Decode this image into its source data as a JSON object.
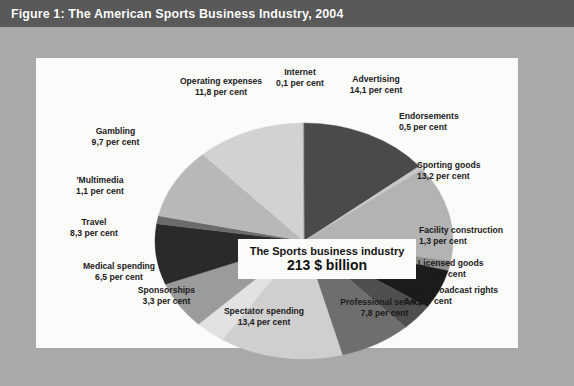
{
  "figure": {
    "title": "Figure 1: The American Sports Business Industry, 2004",
    "center_caption_line1": "The Sports business industry",
    "center_caption_line2": "213 $ billion",
    "unit_suffix": "per cent",
    "colors": {
      "title_band": "#595959",
      "frame": "#a9a9a9",
      "panel": "#fbfbf9"
    }
  },
  "chart_data": {
    "type": "pie",
    "title": "Figure 1: The American Sports Business Industry, 2004",
    "subtitle": "The Sports business industry 213 $ billion",
    "total_label": "213 $ billion",
    "value_unit": "per cent",
    "legend": "none",
    "grid": false,
    "start_angle_deg": 0,
    "direction": "clockwise",
    "categories": [
      "Advertising",
      "Endorsements",
      "Sporting goods",
      "Facility construction",
      "Licensed goods",
      "Media broadcast rights",
      "Professional services",
      "Spectator spending",
      "Sponsorships",
      "Medical spending",
      "Travel",
      "'Multimedia",
      "Gambling",
      "Operating expenses",
      "Internet"
    ],
    "values": [
      14.1,
      0.5,
      13.2,
      1.3,
      5.4,
      3.6,
      7.8,
      13.4,
      3.3,
      6.5,
      8.3,
      1.1,
      9.7,
      11.8,
      0.1
    ],
    "slice_colors": [
      "#4a4a4a",
      "#c9c9c9",
      "#b3b3b3",
      "#8e8e8e",
      "#1c1c1c",
      "#4f4f4f",
      "#6e6e6e",
      "#cfcfcf",
      "#e2e2e2",
      "#9b9b9b",
      "#2a2a2a",
      "#6b6b6b",
      "#b8b8b8",
      "#d2d2d2",
      "#9f9f9f"
    ],
    "slices": [
      {
        "label": "Advertising",
        "value": 14.1,
        "value_text": "14,1 per cent"
      },
      {
        "label": "Endorsements",
        "value": 0.5,
        "value_text": "0,5 per cent"
      },
      {
        "label": "Sporting goods",
        "value": 13.2,
        "value_text": "13,2 per cent"
      },
      {
        "label": "Facility construction",
        "value": 1.3,
        "value_text": "1,3 per cent"
      },
      {
        "label": "Licensed goods",
        "value": 5.4,
        "value_text": "5,4 per cent"
      },
      {
        "label": "Media broadcast rights",
        "value": 3.6,
        "value_text": "3,6 per cent"
      },
      {
        "label": "Professional services",
        "value": 7.8,
        "value_text": "7,8 per cent"
      },
      {
        "label": "Spectator spending",
        "value": 13.4,
        "value_text": "13,4 per cent"
      },
      {
        "label": "Sponsorships",
        "value": 3.3,
        "value_text": "3,3 per cent"
      },
      {
        "label": "Medical spending",
        "value": 6.5,
        "value_text": "6,5 per cent"
      },
      {
        "label": "Travel",
        "value": 8.3,
        "value_text": "8,3 per cent"
      },
      {
        "label": "'Multimedia",
        "value": 1.1,
        "value_text": "1,1 per cent"
      },
      {
        "label": "Gambling",
        "value": 9.7,
        "value_text": "9,7 per cent"
      },
      {
        "label": "Operating expenses",
        "value": 11.8,
        "value_text": "11,8 per cent"
      },
      {
        "label": "Internet",
        "value": 0.1,
        "value_text": "0,1 per cent"
      }
    ]
  },
  "labels": {
    "internet": {
      "name": "Internet",
      "value": "0,1 per cent"
    },
    "advertising": {
      "name": "Advertising",
      "value": "14,1 per cent"
    },
    "endorsements": {
      "name": "Endorsements",
      "value": "0,5 per cent"
    },
    "sporting_goods": {
      "name": "Sporting goods",
      "value": "13,2 per cent"
    },
    "facility": {
      "name": "Facility construction",
      "value": "1,3 per cent"
    },
    "licensed_goods": {
      "name": "Licensed goods",
      "value": "5,4 per cent"
    },
    "media_rights": {
      "name": "Media broadcast rights",
      "value": "3,6 per cent"
    },
    "professional": {
      "name": "Professional services",
      "value": "7,8 per cent"
    },
    "spectator": {
      "name": "Spectator spending",
      "value": "13,4 per cent"
    },
    "sponsorships": {
      "name": "Sponsorships",
      "value": "3,3 per cent"
    },
    "medical": {
      "name": "Medical spending",
      "value": "6,5 per cent"
    },
    "travel": {
      "name": "Travel",
      "value": "8,3 per cent"
    },
    "multimedia": {
      "name": "'Multimedia",
      "value": "1,1 per cent"
    },
    "gambling": {
      "name": "Gambling",
      "value": "9,7 per cent"
    },
    "operating": {
      "name": "Operating expenses",
      "value": "11,8 per cent"
    }
  }
}
